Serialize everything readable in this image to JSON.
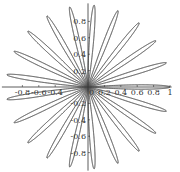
{
  "chart_data": {
    "type": "line",
    "subtype": "polar-rose",
    "equation": "r = cos(21θ)",
    "k": 21,
    "petals": 21,
    "title": "",
    "xlabel": "",
    "ylabel": "",
    "xlim": [
      -1,
      1
    ],
    "ylim": [
      -1,
      1
    ],
    "grid": false,
    "legend": null,
    "x_ticks": [
      {
        "value": -0.8,
        "label": "-0.8"
      },
      {
        "value": -0.6,
        "label": "-0.6"
      },
      {
        "value": -0.4,
        "label": "-0.4"
      },
      {
        "value": 0.2,
        "label": "0.2"
      },
      {
        "value": 0.4,
        "label": "0.4"
      },
      {
        "value": 0.6,
        "label": "0.6"
      },
      {
        "value": 0.8,
        "label": "0.8"
      },
      {
        "value": 1,
        "label": "1"
      }
    ],
    "y_ticks": [
      {
        "value": 0.8,
        "label": "0.8"
      },
      {
        "value": 0.6,
        "label": "0.6"
      },
      {
        "value": 0.4,
        "label": "0.4"
      },
      {
        "value": 0.2,
        "label": "0.2"
      },
      {
        "value": -0.2,
        "label": "-0.2"
      },
      {
        "value": -0.4,
        "label": "-0.4"
      },
      {
        "value": -0.6,
        "label": "-0.6"
      },
      {
        "value": -0.8,
        "label": "-0.8"
      }
    ],
    "origin_label": "0",
    "line_color": "#555555",
    "axis_color": "#333333"
  },
  "layout": {
    "origin_px": [
      88,
      87
    ],
    "scale_px": 82
  }
}
